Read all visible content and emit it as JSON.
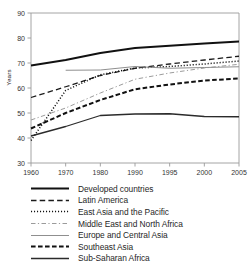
{
  "chart_data": {
    "type": "line",
    "title": "",
    "xlabel": "",
    "ylabel": "Years",
    "xlim": [
      1960,
      2005
    ],
    "ylim": [
      30,
      90
    ],
    "grid": false,
    "legend_position": "below",
    "x": [
      1960,
      1970,
      1980,
      1990,
      1995,
      2000,
      2005
    ],
    "xticks": [
      "1960",
      "1970",
      "1980",
      "1990",
      "1995",
      "2000",
      "2005"
    ],
    "yticks": [
      "30",
      "40",
      "50",
      "60",
      "70",
      "80",
      "90"
    ],
    "series": [
      {
        "name": "Developed countries",
        "style": "solid-thick",
        "color": "#111111",
        "x": [
          1960,
          1970,
          1980,
          1990,
          1995,
          2000,
          2005
        ],
        "values": [
          69.0,
          71.2,
          74.0,
          76.0,
          76.9,
          77.8,
          78.6
        ]
      },
      {
        "name": "Latin America",
        "style": "dashed",
        "color": "#1a1a1a",
        "x": [
          1960,
          1970,
          1980,
          1990,
          1995,
          2000,
          2005
        ],
        "values": [
          56.2,
          60.5,
          65.0,
          67.9,
          69.6,
          71.2,
          72.7
        ]
      },
      {
        "name": "East Asia and the Pacific",
        "style": "dotted",
        "color": "#111111",
        "x": [
          1960,
          1970,
          1980,
          1990,
          1995,
          2000,
          2005
        ],
        "values": [
          39.0,
          59.0,
          65.3,
          68.0,
          68.6,
          69.6,
          70.8
        ]
      },
      {
        "name": "Middle East and North Africa",
        "style": "dash-dot-light",
        "color": "#9b9b9b",
        "x": [
          1960,
          1970,
          1980,
          1990,
          1995,
          2000,
          2005
        ],
        "values": [
          47.2,
          52.0,
          58.0,
          63.5,
          66.0,
          68.0,
          69.5
        ]
      },
      {
        "name": "Europe and Central Asia",
        "style": "solid-thin-gray",
        "color": "#8f8f8f",
        "x": [
          1970,
          1980,
          1990,
          1995,
          2000,
          2005
        ],
        "values": [
          67.1,
          67.2,
          68.6,
          67.9,
          68.2,
          68.5
        ]
      },
      {
        "name": "Southeast Asia",
        "style": "dashed-thick",
        "color": "#111111",
        "x": [
          1960,
          1970,
          1980,
          1990,
          1995,
          2000,
          2005
        ],
        "values": [
          43.8,
          50.0,
          55.2,
          59.5,
          61.4,
          63.0,
          63.8
        ]
      },
      {
        "name": "Sub-Saharan Africa",
        "style": "solid-medium",
        "color": "#2b2b2b",
        "x": [
          1960,
          1970,
          1980,
          1990,
          1995,
          2000,
          2005
        ],
        "values": [
          40.8,
          44.6,
          49.0,
          49.6,
          49.7,
          48.6,
          48.5
        ]
      }
    ]
  },
  "legend": {
    "items": [
      {
        "label": "Developed countries"
      },
      {
        "label": "Latin America"
      },
      {
        "label": "East Asia and the Pacific"
      },
      {
        "label": "Middle East and North Africa"
      },
      {
        "label": "Europe and Central Asia"
      },
      {
        "label": "Southeast Asia"
      },
      {
        "label": "Sub-Saharan Africa"
      }
    ]
  }
}
